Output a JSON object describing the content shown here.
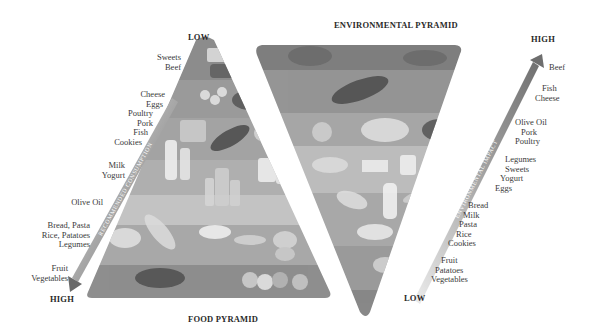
{
  "food_pyramid": {
    "title": "FOOD PYRAMID",
    "top_label": "LOW",
    "bottom_label": "HIGH",
    "arrow_label": "RECOMMENDED CONSUMPTION",
    "levels": [
      {
        "lines": [
          "Sweets",
          "Beef"
        ]
      },
      {
        "lines": [
          "Cheese",
          "Eggs",
          "Poultry",
          "Pork",
          "Fish",
          "Cookies"
        ]
      },
      {
        "lines": [
          "Milk",
          "Yogurt"
        ]
      },
      {
        "lines": [
          "Olive Oil"
        ]
      },
      {
        "lines": [
          "Bread, Pasta",
          "Rice, Patatoes",
          "Legumes"
        ]
      },
      {
        "lines": [
          "Fruit",
          "Vegetables"
        ]
      }
    ],
    "band_colors": [
      "#8c8c8c",
      "#9a9a9a",
      "#a4a4a4",
      "#b0b0b0",
      "#c4c4c4",
      "#a8a8a8",
      "#8e8e8e"
    ]
  },
  "environmental_pyramid": {
    "title": "ENVIRONMENTAL PYRAMID",
    "top_label": "HIGH",
    "bottom_label": "LOW",
    "arrow_label": "ENVIRONMENTAL IMPACT",
    "levels": [
      {
        "lines": [
          "Beef"
        ]
      },
      {
        "lines": [
          "Fish",
          "Cheese"
        ]
      },
      {
        "lines": [
          "Olive Oil",
          "Pork",
          "Poultry"
        ]
      },
      {
        "lines": [
          "Legumes",
          "Sweets",
          "Yogurt",
          "Eggs"
        ]
      },
      {
        "lines": [
          "Bread",
          "Milk",
          "Pasta",
          "Rice",
          "Cookies"
        ]
      },
      {
        "lines": [
          "Fruit",
          "Patatoes",
          "Vegetables"
        ]
      }
    ],
    "band_colors": [
      "#7e7e7e",
      "#959595",
      "#a6a6a6",
      "#bcbcbc",
      "#a9a9a9",
      "#9a9a9a",
      "#888888"
    ]
  }
}
